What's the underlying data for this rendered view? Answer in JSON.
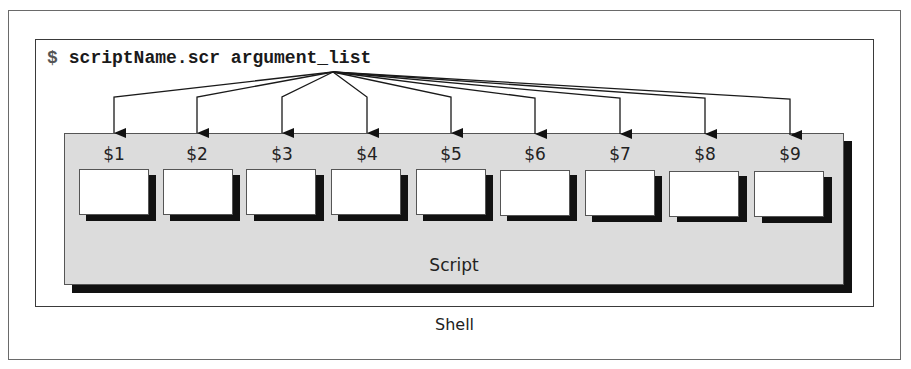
{
  "diagram": {
    "command": {
      "prompt": "$",
      "text": "scriptName.scr argument_list"
    },
    "outer_container_label": "Shell",
    "inner_container_label": "Script",
    "parameters": [
      {
        "label": "$1"
      },
      {
        "label": "$2"
      },
      {
        "label": "$3"
      },
      {
        "label": "$4"
      },
      {
        "label": "$5"
      },
      {
        "label": "$6"
      },
      {
        "label": "$7"
      },
      {
        "label": "$8"
      },
      {
        "label": "$9"
      }
    ],
    "arrow_source": "argument_list",
    "colors": {
      "script_fill": "#dcdcdc",
      "shadow": "#111111",
      "box_fill": "#ffffff",
      "line": "#1a1a1a"
    }
  }
}
